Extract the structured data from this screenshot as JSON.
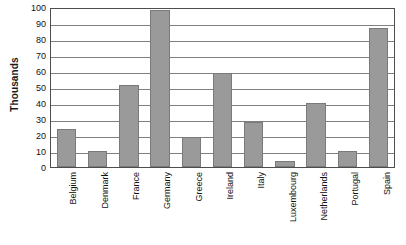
{
  "chart_data": {
    "type": "bar",
    "title": "",
    "xlabel": "",
    "ylabel": "Thousands",
    "ylim": [
      0,
      100
    ],
    "ytick_step": 10,
    "yticks": [
      0,
      10,
      20,
      30,
      40,
      50,
      60,
      70,
      80,
      90,
      100
    ],
    "ytick_labels": [
      "0",
      "10",
      "20",
      "30",
      "40",
      "50",
      "60",
      "70",
      "80",
      "90",
      "100"
    ],
    "grid": "horizontal",
    "legend": "none",
    "categories": [
      "Belgium",
      "Denmark",
      "France",
      "Germany",
      "Greece",
      "Ireland",
      "Italy",
      "Luxembourg",
      "Netherlands",
      "Portugal",
      "Spain"
    ],
    "values": [
      24,
      10,
      51,
      98,
      19,
      59,
      28,
      4,
      40,
      10,
      87
    ],
    "bar_color": "#9a9a9a",
    "bar_border_color": "#7a7a7a",
    "gridline_color": "#808080",
    "plot_border_color": "#4d4d4d",
    "text_color": "#111111"
  }
}
